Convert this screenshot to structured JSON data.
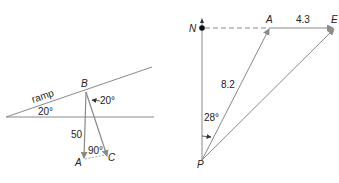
{
  "left_diagram": {
    "labels": {
      "ramp": "ramp",
      "ramp_angle": "20°",
      "point_b": "B",
      "angle_at_b": "20°",
      "length_ba": "50",
      "right_angle": "90°",
      "point_a": "A",
      "point_c": "C"
    }
  },
  "right_diagram": {
    "labels": {
      "north": "N",
      "point_a": "A",
      "length_ae": "4.3",
      "point_e": "E",
      "length_pa": "8.2",
      "bearing_angle": "28°",
      "point_p": "P"
    }
  },
  "colors": {
    "line": "#8a8a8a",
    "text": "#222222"
  }
}
